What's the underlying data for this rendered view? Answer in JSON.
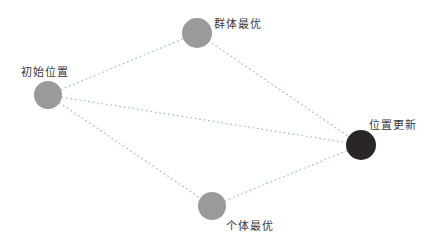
{
  "diagram": {
    "nodes": [
      {
        "id": "start",
        "label": "初始位置",
        "color": "#9a9a9a"
      },
      {
        "id": "global_best",
        "label": "群体最优",
        "color": "#9a9a9a"
      },
      {
        "id": "update",
        "label": "位置更新",
        "color": "#2a2628"
      },
      {
        "id": "personal_best",
        "label": "个体最优",
        "color": "#9a9a9a"
      }
    ],
    "edges": [
      {
        "from": "start",
        "to": "global_best"
      },
      {
        "from": "start",
        "to": "update"
      },
      {
        "from": "start",
        "to": "personal_best"
      },
      {
        "from": "global_best",
        "to": "update"
      },
      {
        "from": "personal_best",
        "to": "update"
      }
    ],
    "edge_color": "#a9c9c6"
  }
}
